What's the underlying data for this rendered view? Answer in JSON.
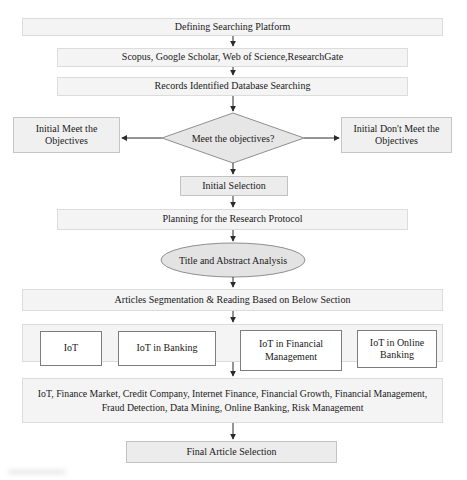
{
  "flowchart": {
    "nodes": {
      "defining": "Defining Searching Platform",
      "platforms": "Scopus, Google Scholar, Web of Science,ResearchGate",
      "records": "Records Identified Database Searching",
      "decision": "Meet the objectives?",
      "meet": "Initial Meet the Objectives",
      "dont_meet": "Initial Don't Meet the Objectives",
      "initial_selection": "Initial Selection",
      "planning": "Planning for the Research Protocol",
      "title_abstract": "Title and Abstract Analysis",
      "articles_segmentation": "Articles Segmentation & Reading Based on Below Section",
      "categories": [
        "IoT",
        "IoT in Banking",
        "IoT in Financial Management",
        "IoT in Online Banking"
      ],
      "keywords": "IoT, Finance Market, Credit Company, Internet Finance, Financial Growth, Financial Management, Fraud Detection, Data Mining, Online Banking, Risk Management",
      "final_selection": "Final Article Selection"
    },
    "colors": {
      "process_fill": "#f4f4f4",
      "process_border": "#dcdcdc",
      "decision_fill": "#e6e6e6",
      "decision_border": "#8f8f8f",
      "ellipse_fill": "#e3e3e3",
      "category_fill": "#ffffff",
      "category_border": "#7d7d7d",
      "arrow": "#2b2b2b",
      "text": "#1a1a1a"
    }
  }
}
